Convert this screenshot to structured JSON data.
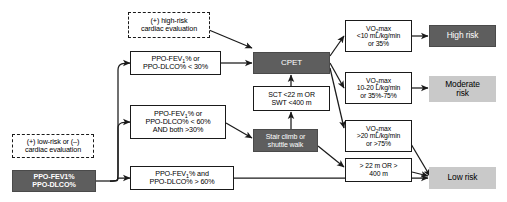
{
  "colors": {
    "dark_fill": "#5e5e5e",
    "light_fill": "#c9c9c9",
    "line": "#1a1a1a",
    "white_fill": "#ffffff"
  },
  "nodes": {
    "high_risk_cardiac": {
      "name": "high-risk-cardiac-evaluation",
      "style": "dashed",
      "lines": [
        "(+) high-risk",
        "cardiac evaluation"
      ]
    },
    "low_risk_cardiac": {
      "name": "low-risk-cardiac-evaluation",
      "style": "dashed",
      "lines": [
        "(+) low-risk or (–)",
        "cardiac evaluation"
      ]
    },
    "ppo_entry": {
      "name": "ppo-entry",
      "style": "dark",
      "lines": [
        "PPO-FEV1%",
        "PPO-DLCO%"
      ]
    },
    "ppo_under30": {
      "name": "ppo-under-30",
      "style": "solid",
      "lines": [
        "PPO-FEV₁% or",
        "PPO-DLCO% < 30%"
      ]
    },
    "ppo_under60": {
      "name": "ppo-under-60",
      "style": "solid",
      "lines": [
        "PPO-FEV₁% or",
        "PPO-DLCO% < 60%",
        "AND both >30%"
      ]
    },
    "ppo_over60": {
      "name": "ppo-over-60",
      "style": "solid",
      "lines": [
        "PPO-FEV₁% and",
        "PPO-DLCO% > 60%"
      ]
    },
    "cpet": {
      "name": "cpet",
      "style": "dark",
      "lines": [
        "CPET"
      ]
    },
    "sct_swt_threshold": {
      "name": "sct-swt-threshold",
      "style": "solid",
      "lines": [
        "SCT <22 m OR",
        "SWT <400 m"
      ]
    },
    "stair_shuttle": {
      "name": "stair-climb-shuttle-walk",
      "style": "dark",
      "lines": [
        "Stair climb or",
        "shuttle walk"
      ]
    },
    "vo2_low": {
      "name": "vo2max-low",
      "style": "solid",
      "lines": [
        "VO₂max",
        "<10 mL/kg/min",
        "or 35%"
      ]
    },
    "vo2_mid": {
      "name": "vo2max-mid",
      "style": "solid",
      "lines": [
        "VO₂max",
        "10-20 L/kg/min",
        "or 35%-75%"
      ]
    },
    "vo2_high": {
      "name": "vo2max-high",
      "style": "solid",
      "lines": [
        "VO₂max",
        ">20 mL/kg/min",
        "or >75%"
      ]
    },
    "sct_swt_pass": {
      "name": "sct-swt-pass",
      "style": "solid",
      "lines": [
        "> 22 m OR >",
        "400 m"
      ]
    },
    "high_risk": {
      "name": "outcome-high-risk",
      "style": "dark",
      "lines": [
        "High risk"
      ]
    },
    "moderate_risk": {
      "name": "outcome-moderate-risk",
      "style": "light",
      "lines": [
        "Moderate",
        "risk"
      ]
    },
    "low_risk": {
      "name": "outcome-low-risk",
      "style": "light",
      "lines": [
        "Low risk"
      ]
    }
  }
}
